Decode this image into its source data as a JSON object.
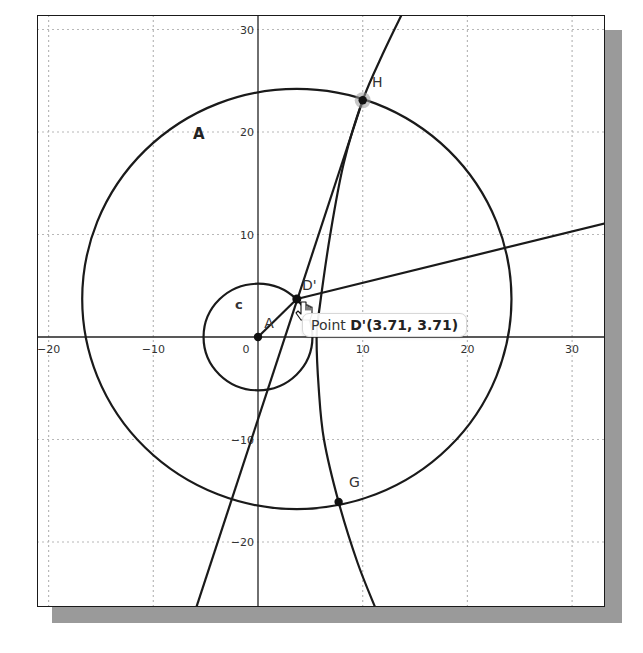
{
  "canvas": {
    "frame": {
      "left": 37,
      "top": 15,
      "right": 605,
      "bottom": 607
    },
    "origin_px": [
      258,
      337
    ],
    "px_per_unit_x": 10.47,
    "px_per_unit_y": 10.25,
    "colors": {
      "stroke": "#1a1a1a",
      "grid": "#b8b8b8",
      "axis": "#222222",
      "highlight": "#999999",
      "shadow": "#9a9a9a"
    }
  },
  "axes": {
    "x_ticks": [
      {
        "value": -20,
        "label": "−20"
      },
      {
        "value": -10,
        "label": "−10"
      },
      {
        "value": 0,
        "label": "0"
      },
      {
        "value": 10,
        "label": "10"
      },
      {
        "value": 20,
        "label": "20"
      },
      {
        "value": 30,
        "label": "30"
      }
    ],
    "y_ticks": [
      {
        "value": 30,
        "label": "30"
      },
      {
        "value": 20,
        "label": "20"
      },
      {
        "value": 10,
        "label": "10"
      },
      {
        "value": -10,
        "label": "−10"
      },
      {
        "value": -20,
        "label": "−20"
      }
    ],
    "grid_x": [
      -20,
      -10,
      10,
      20,
      30
    ],
    "grid_y": [
      30,
      20,
      10,
      -10,
      -20
    ]
  },
  "objects": {
    "circle_c": {
      "label": "c",
      "center": [
        0,
        0
      ],
      "radius": 5.2,
      "label_pos": [
        -2.2,
        2.7
      ]
    },
    "circle_A": {
      "label": "A",
      "center": [
        3.71,
        3.71
      ],
      "radius": 20.5,
      "label_pos": [
        -6.2,
        19.3
      ]
    },
    "point_A": {
      "label": "A",
      "coords": [
        0,
        0
      ],
      "label_pos": [
        0.6,
        0.9
      ]
    },
    "point_D": {
      "label": "D'",
      "coords": [
        3.71,
        3.71
      ],
      "label_pos": [
        4.2,
        4.6
      ]
    },
    "point_H": {
      "label": "H",
      "coords": [
        10.0,
        23.1
      ],
      "label_pos": [
        10.9,
        24.4
      ],
      "highlighted": true
    },
    "point_G": {
      "label": "G",
      "coords": [
        7.7,
        -16.1
      ],
      "label_pos": [
        8.7,
        -14.6
      ]
    },
    "segment_AD": {
      "from": [
        0,
        0
      ],
      "to": [
        3.71,
        3.71
      ]
    },
    "line_DH": {
      "from": [
        -5.9,
        -26.4
      ],
      "to": [
        10.0,
        23.1
      ]
    },
    "ray_D": {
      "from": [
        3.71,
        3.71
      ],
      "to": [
        33.2,
        11.1
      ]
    },
    "hyperbola_branch": {
      "points": [
        [
          13.7,
          31.4
        ],
        [
          12.0,
          27.8
        ],
        [
          10.0,
          23.1
        ],
        [
          8.2,
          17.0
        ],
        [
          6.9,
          10.0
        ],
        [
          5.9,
          3.0
        ],
        [
          5.6,
          0
        ],
        [
          5.8,
          -5.0
        ],
        [
          6.3,
          -10.0
        ],
        [
          7.7,
          -16.1
        ],
        [
          9.5,
          -22.0
        ],
        [
          11.2,
          -26.4
        ]
      ]
    }
  },
  "tooltip": {
    "prefix": "Point ",
    "value": "D'(3.71, 3.71)",
    "left": 302,
    "top": 313
  },
  "cursor": {
    "type": "hand-pointer-icon",
    "x": 301,
    "y": 302
  }
}
